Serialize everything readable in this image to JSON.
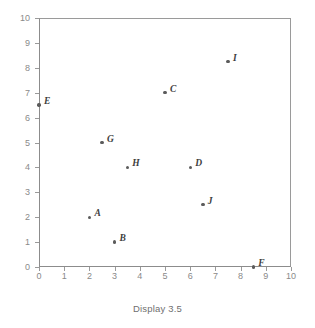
{
  "caption": "Display 3.5",
  "chart_data": {
    "type": "scatter",
    "title": "",
    "subtitle": "",
    "xlabel": "",
    "ylabel": "",
    "xlim": [
      0,
      10
    ],
    "ylim": [
      0,
      10
    ],
    "xticks": [
      "0",
      "1",
      "2",
      "3",
      "4",
      "5",
      "6",
      "7",
      "8",
      "9",
      "10"
    ],
    "yticks": [
      "0",
      "1",
      "2",
      "3",
      "4",
      "5",
      "6",
      "7",
      "8",
      "9",
      "10"
    ],
    "grid": false,
    "legend": "none",
    "point_color": "#5b5b5b",
    "axis_color": "#9a9a9a",
    "points": [
      {
        "label": "A",
        "x": 2,
        "y": 2
      },
      {
        "label": "B",
        "x": 3,
        "y": 1
      },
      {
        "label": "C",
        "x": 5,
        "y": 7
      },
      {
        "label": "D",
        "x": 6,
        "y": 4
      },
      {
        "label": "E",
        "x": 0,
        "y": 6.5
      },
      {
        "label": "F",
        "x": 8.5,
        "y": 0
      },
      {
        "label": "G",
        "x": 2.5,
        "y": 5
      },
      {
        "label": "H",
        "x": 3.5,
        "y": 4
      },
      {
        "label": "I",
        "x": 7.5,
        "y": 8.25
      },
      {
        "label": "J",
        "x": 6.5,
        "y": 2.5
      }
    ]
  }
}
